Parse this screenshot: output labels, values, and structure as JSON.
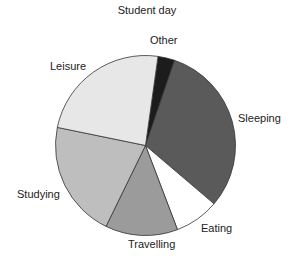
{
  "chart_data": {
    "type": "pie",
    "title": "Student day",
    "start_angle_deg": 8,
    "direction": "clockwise",
    "slices": [
      {
        "label": "Other",
        "value": 3,
        "color": "#1c1c1c"
      },
      {
        "label": "Sleeping",
        "value": 31,
        "color": "#5a5a5a"
      },
      {
        "label": "Eating",
        "value": 8,
        "color": "#ffffff"
      },
      {
        "label": "Travelling",
        "value": 13,
        "color": "#9b9b9b"
      },
      {
        "label": "Studying",
        "value": 21,
        "color": "#bebebe"
      },
      {
        "label": "Leisure",
        "value": 24,
        "color": "#e7e7e7"
      }
    ],
    "legend": "none (direct labels)"
  },
  "labels": {
    "other": "Other",
    "sleeping": "Sleeping",
    "eating": "Eating",
    "travelling": "Travelling",
    "studying": "Studying",
    "leisure": "Leisure"
  }
}
